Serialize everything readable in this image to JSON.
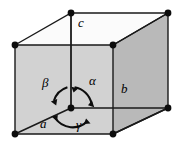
{
  "figure": {
    "name": "unit-cell-axes-diagram",
    "background_color": "#ffffff",
    "stroke_color": "#1a1a1a",
    "face_colors": {
      "front": "#d2d2d2",
      "right": "#b9b9b9",
      "top": "#fbfbfb"
    },
    "vertex_color": "#0d0d0d"
  },
  "axis_labels": [
    {
      "id": "a",
      "text": "a",
      "x": 40,
      "y": 124
    },
    {
      "id": "b",
      "text": "b",
      "x": 121,
      "y": 89
    },
    {
      "id": "c",
      "text": "c",
      "x": 78,
      "y": 22
    }
  ],
  "angle_labels": [
    {
      "id": "alpha",
      "text": "α",
      "x": 89,
      "y": 81
    },
    {
      "id": "beta",
      "text": "β",
      "x": 42,
      "y": 83
    },
    {
      "id": "gamma",
      "text": "γ",
      "x": 76,
      "y": 125
    }
  ],
  "geometry": {
    "vertices": [
      {
        "id": "top-back-left",
        "x": 15,
        "y": 45
      },
      {
        "id": "top-front-center",
        "x": 71,
        "y": 13
      },
      {
        "id": "top-back-center",
        "x": 113,
        "y": 45
      },
      {
        "id": "top-front-right",
        "x": 168,
        "y": 13
      },
      {
        "id": "bottom-back-left",
        "x": 15,
        "y": 134
      },
      {
        "id": "bottom-back-right",
        "x": 113,
        "y": 134
      },
      {
        "id": "bottom-front-right",
        "x": 168,
        "y": 108
      }
    ],
    "origin": {
      "id": "origin",
      "x": 71,
      "y": 108
    },
    "circle": {
      "cx": 71,
      "cy": 108,
      "r": 21
    }
  }
}
